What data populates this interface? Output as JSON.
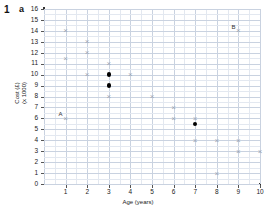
{
  "question": {
    "number": "1",
    "part": "a"
  },
  "chart_data": {
    "type": "scatter",
    "title": "",
    "xlabel": "Age (years)",
    "ylabel": "Cost (£)",
    "ylabel_line2": "(x 1000)",
    "xlim": [
      0,
      10
    ],
    "ylim": [
      0,
      16
    ],
    "xticks": [
      "1",
      "2",
      "3",
      "4",
      "5",
      "6",
      "7",
      "8",
      "9",
      "10"
    ],
    "yticks": [
      "0",
      "1",
      "2",
      "3",
      "4",
      "5",
      "6",
      "7",
      "8",
      "9",
      "10",
      "11",
      "12",
      "13",
      "14",
      "15",
      "16"
    ],
    "grid": true,
    "legend": "none",
    "series": [
      {
        "name": "data-crosses",
        "marker": "cross",
        "color": "#9aa3b2",
        "points": [
          {
            "x": 1,
            "y": 14
          },
          {
            "x": 1,
            "y": 11.5
          },
          {
            "x": 1,
            "y": 6,
            "label": "A"
          },
          {
            "x": 2,
            "y": 13
          },
          {
            "x": 2,
            "y": 12
          },
          {
            "x": 2,
            "y": 10
          },
          {
            "x": 3,
            "y": 11
          },
          {
            "x": 3,
            "y": 8
          },
          {
            "x": 4,
            "y": 10
          },
          {
            "x": 5,
            "y": 8
          },
          {
            "x": 6,
            "y": 7
          },
          {
            "x": 6,
            "y": 6
          },
          {
            "x": 7,
            "y": 6
          },
          {
            "x": 7,
            "y": 4
          },
          {
            "x": 8,
            "y": 4
          },
          {
            "x": 8,
            "y": 1
          },
          {
            "x": 9,
            "y": 14,
            "label": "B"
          },
          {
            "x": 9,
            "y": 4
          },
          {
            "x": 9,
            "y": 3
          },
          {
            "x": 10,
            "y": 3
          }
        ]
      },
      {
        "name": "highlighted-points",
        "marker": "filled-circle",
        "color": "#000000",
        "points": [
          {
            "x": 3,
            "y": 10
          },
          {
            "x": 3,
            "y": 9
          },
          {
            "x": 7,
            "y": 5.5
          }
        ]
      }
    ],
    "annotations": [
      {
        "text": "A",
        "x": 1,
        "y": 6,
        "offset": "left-above"
      },
      {
        "text": "B",
        "x": 9,
        "y": 14,
        "offset": "left-above"
      }
    ]
  }
}
